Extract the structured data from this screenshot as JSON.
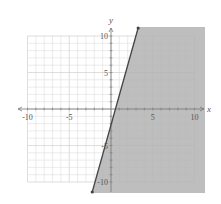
{
  "chart_data": {
    "type": "inequality-graph",
    "title": "",
    "xlabel": "x",
    "ylabel": "y",
    "xlim": [
      -10,
      10
    ],
    "ylim": [
      -10,
      10
    ],
    "x_ticks": [
      -10,
      -5,
      5,
      10
    ],
    "y_ticks": [
      10,
      5,
      -5,
      -10
    ],
    "grid": true,
    "grid_step": 1,
    "boundary_line": {
      "equation": "y = 4x - 2",
      "slope": 4,
      "intercept": -2,
      "style": "solid",
      "endpoints": [
        [
          -2.25,
          -11
        ],
        [
          3.25,
          11
        ]
      ]
    },
    "shaded_region": "right of line (y <= 4x - 2)",
    "inequality": "y <= 4x - 2"
  },
  "labels": {
    "x_axis": "x",
    "y_axis": "y",
    "x_ticks": [
      "-10",
      "-5",
      "5",
      "10"
    ],
    "y_ticks": [
      "10",
      "5",
      "-5",
      "-10"
    ]
  },
  "colors": {
    "shade": "#b3b3b3",
    "line": "#444444",
    "grid": "#dddddd",
    "grid_major": "#c8c8c8",
    "axis": "#777777"
  }
}
